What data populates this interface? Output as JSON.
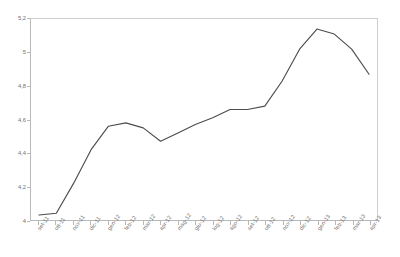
{
  "chart_data": {
    "type": "line",
    "title": "",
    "subtitle": "",
    "xlabel": "",
    "ylabel": "",
    "ylim": [
      4,
      5.2
    ],
    "yticks": [
      4,
      4.2,
      4.4,
      4.6,
      4.8,
      5,
      5.2
    ],
    "ytick_labels": [
      "4",
      "4,2",
      "4,4",
      "4,6",
      "4,8",
      "5",
      "5,2"
    ],
    "grid": false,
    "legend": false,
    "legend_position": "none",
    "line_color": "#4d4d4d",
    "axis_color": "#b9b9b9",
    "background": "#ffffff",
    "categories": [
      "set-11",
      "ott-11",
      "nov-11",
      "dic-11",
      "gen-12",
      "feb-12",
      "mar-12",
      "apr-12",
      "mag-12",
      "giu-12",
      "lug-12",
      "ago-12",
      "set-12",
      "ott-12",
      "nov-12",
      "dic-12",
      "gen-13",
      "feb-13",
      "mar-13",
      "apr-13"
    ],
    "values": [
      4.03,
      4.04,
      4.22,
      4.42,
      4.56,
      4.58,
      4.55,
      4.47,
      4.52,
      4.57,
      4.61,
      4.66,
      4.66,
      4.68,
      4.83,
      5.02,
      5.14,
      5.11,
      5.02,
      4.87
    ],
    "series": [
      {
        "name": "serie1",
        "values": [
          4.03,
          4.04,
          4.22,
          4.42,
          4.56,
          4.58,
          4.55,
          4.47,
          4.52,
          4.57,
          4.61,
          4.66,
          4.66,
          4.68,
          4.83,
          5.02,
          5.14,
          5.11,
          5.02,
          4.87
        ]
      }
    ]
  }
}
